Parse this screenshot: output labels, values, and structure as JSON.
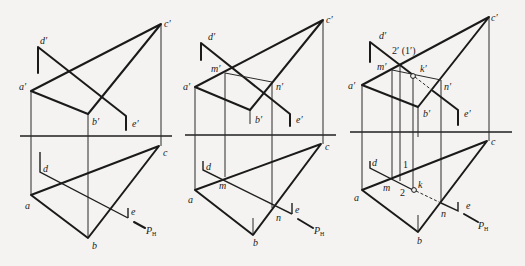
{
  "figure": {
    "panels": [
      {
        "id": "panel-1",
        "labels": {
          "a_prime": "a′",
          "b_prime": "b′",
          "c_prime": "c′",
          "d_prime": "d′",
          "e_prime": "e′",
          "a": "a",
          "b": "b",
          "c": "c",
          "d": "d",
          "e": "e",
          "trace": "P",
          "trace_sub": "H"
        }
      },
      {
        "id": "panel-2",
        "labels": {
          "a_prime": "a′",
          "b_prime": "b′",
          "c_prime": "c′",
          "d_prime": "d′",
          "e_prime": "e′",
          "m_prime": "m′",
          "n_prime": "n′",
          "a": "a",
          "b": "b",
          "c": "c",
          "d": "d",
          "e": "e",
          "m": "m",
          "n": "n",
          "trace": "P",
          "trace_sub": "H"
        }
      },
      {
        "id": "panel-3",
        "labels": {
          "a_prime": "a′",
          "b_prime": "b′",
          "c_prime": "c′",
          "d_prime": "d′",
          "e_prime": "e′",
          "m_prime": "m′",
          "n_prime": "n′",
          "k_prime": "k′",
          "visibility_pair": "2′ (1′)",
          "a": "a",
          "b": "b",
          "c": "c",
          "d": "d",
          "e": "e",
          "m": "m",
          "n": "n",
          "k": "k",
          "pt1": "1",
          "pt2": "2",
          "trace": "P",
          "trace_sub": "H"
        }
      }
    ]
  }
}
